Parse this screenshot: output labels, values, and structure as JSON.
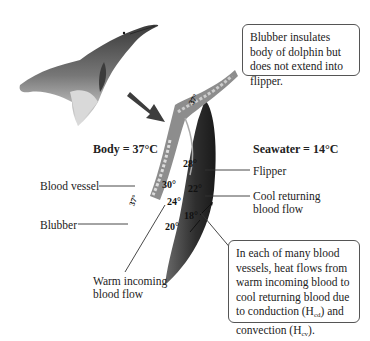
{
  "diagram": {
    "callout_top": "Blubber insulates body of dolphin but does not extend into flipper.",
    "callout_bottom_prefix": "In each of many blood vessels, heat flows from warm incoming blood to cool returning blood due to conduction (H",
    "callout_bottom_sub1": "cd",
    "callout_bottom_mid": ") and convection (H",
    "callout_bottom_sub2": "cv",
    "callout_bottom_suffix": ").",
    "body_temp": "Body = 37°C",
    "seawater_temp": "Seawater = 14°C",
    "labels": {
      "flipper": "Flipper",
      "blood_vessel": "Blood vessel",
      "blubber": "Blubber",
      "cool_returning_1": "Cool returning",
      "cool_returning_2": "blood flow",
      "warm_incoming_1": "Warm incoming",
      "warm_incoming_2": "blood flow"
    },
    "temperatures": {
      "t37_top": "37°",
      "t37_side": "37°",
      "t28": "28°",
      "t30": "30°",
      "t22": "22°",
      "t24": "24°",
      "t18": "18°",
      "t20": "20°"
    }
  }
}
